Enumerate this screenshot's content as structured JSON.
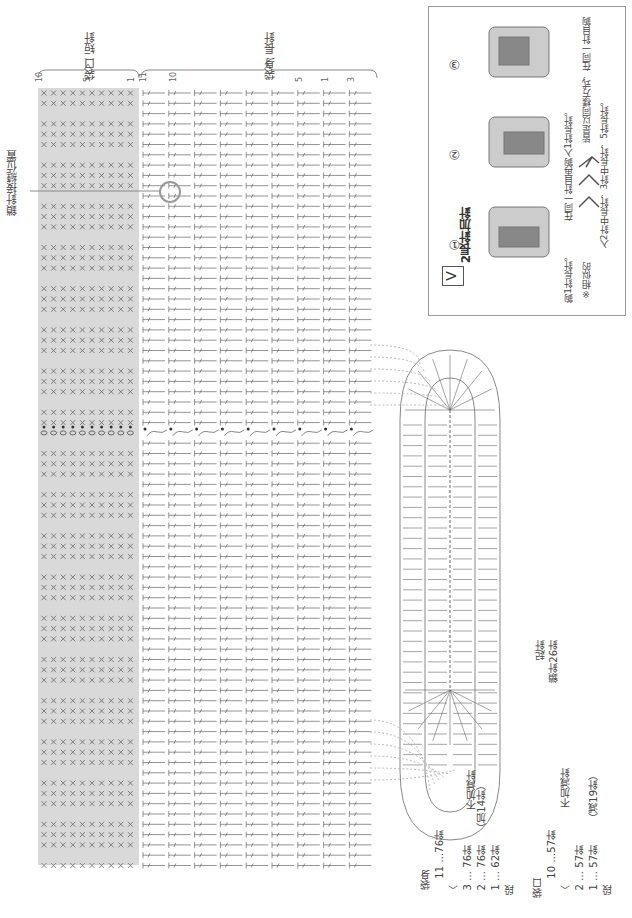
{
  "diagram": {
    "sections": {
      "bag_mouth": {
        "label": "袋口\n短針",
        "row_numbers": [
          "10",
          "5",
          "1"
        ]
      },
      "bag_body": {
        "label": "袋身\n長針",
        "row_numbers": [
          "11",
          "10",
          "5",
          "1",
          "3"
        ]
      }
    },
    "side_label": "鎖針接縫位置",
    "foundation": {
      "label_line1": "起針",
      "label_line2": "鎖針26針"
    },
    "legend": {
      "symbol": "V",
      "title": "2長針加針",
      "steps": [
        "①",
        "②",
        "③"
      ],
      "text_lines": [
        "鉤1針長針。",
        "在同一針目再鉤入1針長針。",
        "※相似的",
        "皆是以同樣方式，在同一針目鉤",
        "入2針中長針，3針中長針，5針長針。"
      ]
    },
    "summary": {
      "body": {
        "title": "袋身",
        "rows": [
          {
            "row": "11",
            "count": "…76針",
            "note": ""
          },
          {
            "row": "〈",
            "count": "",
            "note": "不加減針"
          },
          {
            "row": "3",
            "count": "… 76針",
            "note": ""
          },
          {
            "row": "2",
            "count": "… 76針",
            "note": "（加14針）"
          },
          {
            "row": "1",
            "count": "… 62針",
            "note": ""
          }
        ],
        "footer": "段"
      },
      "mouth": {
        "title": "袋口",
        "rows": [
          {
            "row": "10",
            "count": "…57針",
            "note": ""
          },
          {
            "row": "〈",
            "count": "",
            "note": "不加減針"
          },
          {
            "row": "2",
            "count": "… 57針",
            "note": ""
          },
          {
            "row": "1",
            "count": "… 57針",
            "note": "（減19針）"
          }
        ],
        "footer": "段"
      }
    },
    "colors": {
      "gray_band": "#d9d9d9",
      "line": "#888888",
      "stitch": "#666666",
      "circle": "#999999"
    }
  }
}
